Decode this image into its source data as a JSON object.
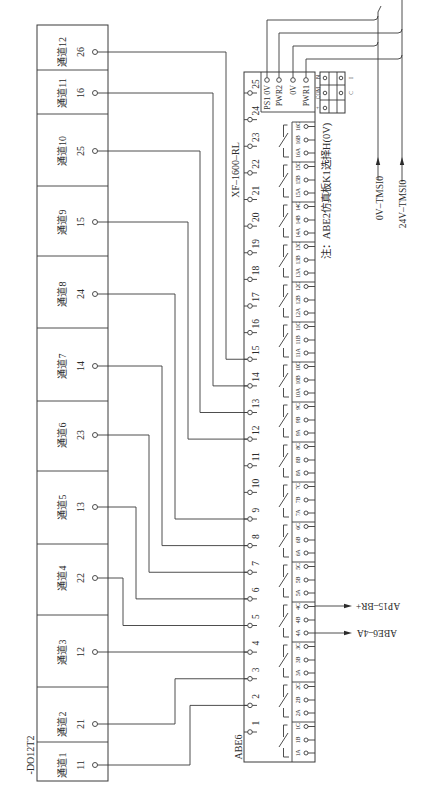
{
  "module": {
    "label": "-DO12T2",
    "channels": [
      {
        "name": "通道1",
        "pin": "11"
      },
      {
        "name": "通道2",
        "pin": "21"
      },
      {
        "name": "通道3",
        "pin": "12"
      },
      {
        "name": "通道4",
        "pin": "22"
      },
      {
        "name": "通道5",
        "pin": "13"
      },
      {
        "name": "通道6",
        "pin": "23"
      },
      {
        "name": "通道7",
        "pin": "14"
      },
      {
        "name": "通道8",
        "pin": "24"
      },
      {
        "name": "通道9",
        "pin": "15"
      },
      {
        "name": "通道10",
        "pin": "25"
      },
      {
        "name": "通道11",
        "pin": "16"
      },
      {
        "name": "通道12",
        "pin": "26"
      }
    ]
  },
  "terminal_block": {
    "label": "ABE6",
    "model": "XF–1600–RL",
    "terminals": [
      "1",
      "2",
      "3",
      "4",
      "5",
      "6",
      "7",
      "8",
      "9",
      "10",
      "11",
      "12",
      "13",
      "14",
      "15",
      "16",
      "17",
      "18",
      "19",
      "20",
      "21",
      "22",
      "23",
      "24",
      "25"
    ],
    "power_terminals": [
      "PS1 0V",
      "PWR2",
      "0V",
      "PWR1"
    ],
    "relays": [
      {
        "a": "1A",
        "b": "1B",
        "c": "1C"
      },
      {
        "a": "2A",
        "b": "2B",
        "c": "2C"
      },
      {
        "a": "3A",
        "b": "3B",
        "c": "3C"
      },
      {
        "a": "4A",
        "b": "4B",
        "c": "4C"
      },
      {
        "a": "5A",
        "b": "5B",
        "c": "5C"
      },
      {
        "a": "6A",
        "b": "6B",
        "c": "6C"
      },
      {
        "a": "7A",
        "b": "7B",
        "c": "7C"
      },
      {
        "a": "8A",
        "b": "8B",
        "c": "8C"
      },
      {
        "a": "9A",
        "b": "9B",
        "c": "9C"
      },
      {
        "a": "10A",
        "b": "10B",
        "c": "10C"
      },
      {
        "a": "11A",
        "b": "11B",
        "c": "11C"
      },
      {
        "a": "12A",
        "b": "12B",
        "c": "12C"
      },
      {
        "a": "13A",
        "b": "13B",
        "c": "13C"
      },
      {
        "a": "14A",
        "b": "14B",
        "c": "14C"
      },
      {
        "a": "15A",
        "b": "15B",
        "c": "15C"
      },
      {
        "a": "16A",
        "b": "16B",
        "c": "16C"
      }
    ]
  },
  "selector_switch": {
    "left_labels": [
      "N",
      "COM",
      "+"
    ],
    "right_labels": [
      "I",
      "C"
    ]
  },
  "note": "注：ABE2仿真板K1选择H(0V)",
  "external_signals": {
    "zero_v": "0V–TMSI0",
    "v24": "24V–TMSI0",
    "relay4_c_out": "AP15–BR+",
    "relay4_a_out": "ABE6–4A"
  },
  "wiring": [
    {
      "channel": "通道1",
      "pin": "11",
      "terminal": "2"
    },
    {
      "channel": "通道2",
      "pin": "21",
      "terminal": "3"
    },
    {
      "channel": "通道3",
      "pin": "12",
      "terminal": "4"
    },
    {
      "channel": "通道4",
      "pin": "22",
      "terminal": "5"
    },
    {
      "channel": "通道5",
      "pin": "13",
      "terminal": "6"
    },
    {
      "channel": "通道6",
      "pin": "23",
      "terminal": "7"
    },
    {
      "channel": "通道7",
      "pin": "14",
      "terminal": "8"
    },
    {
      "channel": "通道8",
      "pin": "24",
      "terminal": "9"
    },
    {
      "channel": "通道9",
      "pin": "15",
      "terminal": "12"
    },
    {
      "channel": "通道10",
      "pin": "25",
      "terminal": "13"
    },
    {
      "channel": "通道11",
      "pin": "16",
      "terminal": "14"
    },
    {
      "channel": "通道12",
      "pin": "26",
      "terminal": "15"
    }
  ],
  "power_wiring": [
    {
      "from": "PS1 0V",
      "to": "0V–TMSI0"
    },
    {
      "from": "PWR2",
      "to": "24V–TMSI0"
    },
    {
      "from": "0V",
      "to": "0V–TMSI0"
    },
    {
      "from": "PWR1",
      "to": "24V–TMSI0"
    }
  ]
}
